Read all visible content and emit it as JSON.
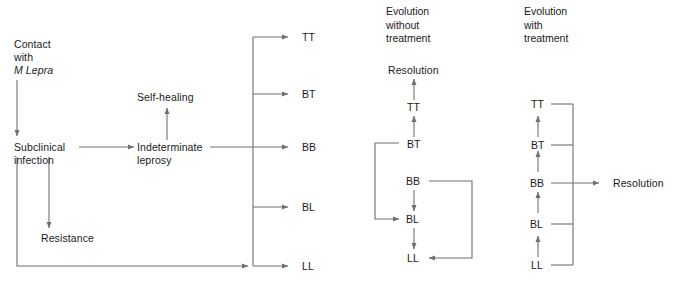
{
  "figure": {
    "background_color": "#ffffff",
    "line_color": "#6f6f6f",
    "text_color": "#1a1a1a"
  },
  "panel_left": {
    "nodes": {
      "contact": "Contact\nwith\n",
      "contact_organism": "M Lepra",
      "subclinical": "Subclinical\ninfection",
      "self_healing": "Self-healing",
      "indeterminate": "Indeterminate\nleprosy",
      "resistance": "Resistance"
    },
    "spectrum": [
      {
        "code": "TT",
        "full": "Tuberculoid"
      },
      {
        "code": "BT",
        "full": "Borderline tuberculoid"
      },
      {
        "code": "BB",
        "full": "Mid-borderline"
      },
      {
        "code": "BL",
        "full": "Borderline lepromatous"
      },
      {
        "code": "LL",
        "full": "Lepromatous"
      }
    ]
  },
  "panel_middle": {
    "heading": "Evolution\nwithout\ntreatment",
    "nodes": {
      "resolution": "Resolution",
      "tt": "TT",
      "bt": "BT",
      "bb": "BB",
      "bl": "BL",
      "ll": "LL"
    }
  },
  "panel_right": {
    "heading": "Evolution\nwith\ntreatment",
    "nodes": {
      "tt": "TT",
      "bt": "BT",
      "bb": "BB",
      "bl": "BL",
      "ll": "LL",
      "resolution": "Resolution"
    }
  }
}
